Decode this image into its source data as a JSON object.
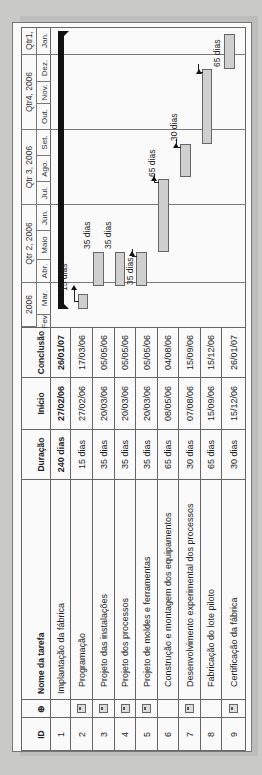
{
  "table": {
    "headers": {
      "id": "ID",
      "indicator": "⊕",
      "name": "Nome da tarefa",
      "duration": "Duração",
      "start": "Início",
      "finish": "Conclusão"
    },
    "rows": [
      {
        "id": "1",
        "note": false,
        "name": "Implantação da fábrica",
        "duration": "240 dias",
        "start": "27/02/06",
        "finish": "26/01/07",
        "summary": true
      },
      {
        "id": "2",
        "note": true,
        "name": "Programação",
        "duration": "15 dias",
        "start": "27/02/06",
        "finish": "17/03/06"
      },
      {
        "id": "3",
        "note": true,
        "name": "Projeto das instalações",
        "duration": "35 dias",
        "start": "20/03/06",
        "finish": "05/05/06"
      },
      {
        "id": "4",
        "note": true,
        "name": "Projeto dos processos",
        "duration": "35 dias",
        "start": "20/03/06",
        "finish": "05/05/06"
      },
      {
        "id": "5",
        "note": true,
        "name": "Projeto de moldes e ferramentas",
        "duration": "35 dias",
        "start": "20/03/06",
        "finish": "05/05/06"
      },
      {
        "id": "6",
        "note": false,
        "name": "Construção e montagem dos equipamentos",
        "duration": "65 dias",
        "start": "08/05/06",
        "finish": "04/08/06"
      },
      {
        "id": "7",
        "note": true,
        "name": "Desenvolvimento experimental dos processos",
        "duration": "30 dias",
        "start": "07/08/06",
        "finish": "15/09/06"
      },
      {
        "id": "8",
        "note": false,
        "name": "Fabricação do lote piloto",
        "duration": "65 dias",
        "start": "15/09/06",
        "finish": "15/12/06"
      },
      {
        "id": "9",
        "note": true,
        "name": "Certificação da fábrica",
        "duration": "30 dias",
        "start": "15/12/06",
        "finish": "26/01/07"
      }
    ]
  },
  "timeline": {
    "quarters": [
      "2006",
      "Qtr 2, 2006",
      "Qtr 3, 2006",
      "Qtr4, 2006",
      "Qtr1,"
    ],
    "months": [
      "Fev.",
      "Mar.",
      "Abr.",
      "Maio",
      "Jun.",
      "Jul.",
      "Ago.",
      "Set.",
      "Out.",
      "Nov.",
      "Dez.",
      "Jan."
    ]
  },
  "bar_labels": {
    "r2": "15 dias",
    "r3": "35 dias",
    "r4": "35 dias",
    "r5": "35 dias",
    "r6": "65 dias",
    "r7": "30 dias",
    "r8": "65 dias"
  },
  "colors": {
    "bar_fill": "#cfcfcf",
    "summary_bar": "#111111",
    "grid": "#666666",
    "background": "#c9c9c7"
  }
}
